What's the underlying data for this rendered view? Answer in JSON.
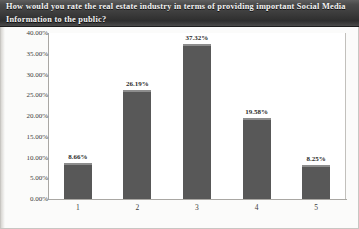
{
  "title": {
    "text": "How would you rate the real estate industry in terms of providing important Social Media Information to the public?"
  },
  "colors": {
    "bar": "#585858",
    "bar_highlight": "#8d8d8d",
    "title_bar": "#3a3a3a",
    "axis": "#a9a7a3",
    "plot_background": "#ffffff",
    "frame_background": "#fbfbfa"
  },
  "chart_data": {
    "type": "bar",
    "title": "How would you rate the real estate industry in terms of providing important Social Media Information to the public?",
    "categories": [
      "1",
      "2",
      "3",
      "4",
      "5"
    ],
    "values": [
      8.66,
      26.19,
      37.32,
      19.58,
      8.25
    ],
    "data_labels": [
      "8.66%",
      "26.19%",
      "37.32%",
      "19.58%",
      "8.25%"
    ],
    "xlabel": "",
    "ylabel": "",
    "ylim": [
      0,
      40
    ],
    "ytick_step": 5,
    "ytick_labels": [
      "0.00%",
      "5.00%",
      "10.00%",
      "15.00%",
      "20.00%",
      "25.00%",
      "30.00%",
      "35.00%",
      "40.00%"
    ],
    "ytick_values": [
      0,
      5,
      10,
      15,
      20,
      25,
      30,
      35,
      40
    ],
    "grid": false,
    "legend": false,
    "series": [
      {
        "name": "Response share",
        "values": [
          8.66,
          26.19,
          37.32,
          19.58,
          8.25
        ]
      }
    ]
  }
}
